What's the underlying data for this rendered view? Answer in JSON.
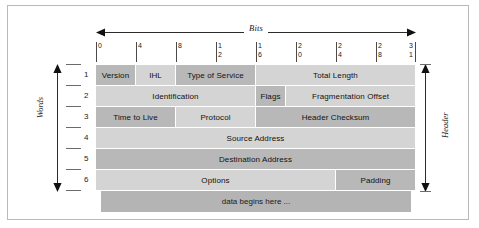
{
  "figure": {
    "bits_axis_label": "Bits",
    "words_axis_label": "Words",
    "header_bracket_label": "Header",
    "data_row_label": "data begins here ..."
  },
  "bit_ruler": {
    "ticks": [
      {
        "bit": 0,
        "digits": [
          "0"
        ]
      },
      {
        "bit": 4,
        "digits": [
          "4"
        ]
      },
      {
        "bit": 8,
        "digits": [
          "8"
        ]
      },
      {
        "bit": 12,
        "digits": [
          "1",
          "2"
        ]
      },
      {
        "bit": 16,
        "digits": [
          "1",
          "6"
        ]
      },
      {
        "bit": 20,
        "digits": [
          "2",
          "0"
        ]
      },
      {
        "bit": 24,
        "digits": [
          "2",
          "4"
        ]
      },
      {
        "bit": 28,
        "digits": [
          "2",
          "8"
        ]
      },
      {
        "bit": 31,
        "digits": [
          "3",
          "1"
        ]
      }
    ]
  },
  "word_numbers": [
    "1",
    "2",
    "3",
    "4",
    "5",
    "6"
  ],
  "rows": [
    {
      "word": "1",
      "fields": [
        {
          "label": "Version",
          "start_bit": 0,
          "end_bit": 4,
          "shade": "dark"
        },
        {
          "label": "IHL",
          "start_bit": 4,
          "end_bit": 8,
          "shade": "light"
        },
        {
          "label": "Type of Service",
          "start_bit": 8,
          "end_bit": 16,
          "shade": "dark"
        },
        {
          "label": "Total Length",
          "start_bit": 16,
          "end_bit": 32,
          "shade": "light"
        }
      ]
    },
    {
      "word": "2",
      "fields": [
        {
          "label": "Identification",
          "start_bit": 0,
          "end_bit": 16,
          "shade": "light"
        },
        {
          "label": "Flags",
          "start_bit": 16,
          "end_bit": 19,
          "shade": "dark"
        },
        {
          "label": "Fragmentation Offset",
          "start_bit": 19,
          "end_bit": 32,
          "shade": "light"
        }
      ]
    },
    {
      "word": "3",
      "fields": [
        {
          "label": "Time to Live",
          "start_bit": 0,
          "end_bit": 8,
          "shade": "dark"
        },
        {
          "label": "Protocol",
          "start_bit": 8,
          "end_bit": 16,
          "shade": "light"
        },
        {
          "label": "Header Checksum",
          "start_bit": 16,
          "end_bit": 32,
          "shade": "dark"
        }
      ]
    },
    {
      "word": "4",
      "fields": [
        {
          "label": "Source Address",
          "start_bit": 0,
          "end_bit": 32,
          "shade": "light"
        }
      ]
    },
    {
      "word": "5",
      "fields": [
        {
          "label": "Destination Address",
          "start_bit": 0,
          "end_bit": 32,
          "shade": "dark"
        }
      ]
    },
    {
      "word": "6",
      "fields": [
        {
          "label": "Options",
          "start_bit": 0,
          "end_bit": 24,
          "shade": "light"
        },
        {
          "label": "Padding",
          "start_bit": 24,
          "end_bit": 32,
          "shade": "dark"
        }
      ]
    }
  ],
  "colors": {
    "shade_dark": "#b8b8b8",
    "shade_light": "#d4d4d4",
    "data_row": "#b4b4b4",
    "frame_border": "#b9b9b9",
    "rule": "#4a4a4a",
    "page_background": "#ffffff"
  }
}
